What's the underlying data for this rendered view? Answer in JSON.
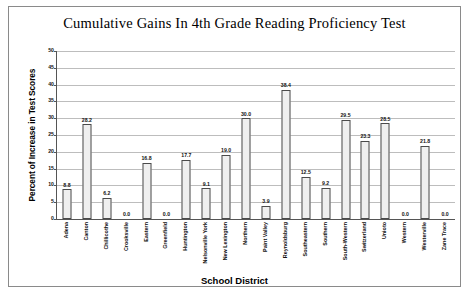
{
  "chart_data": {
    "type": "bar",
    "title": "Cumulative Gains In 4th Grade Reading Proficiency Test",
    "xlabel": "School District",
    "ylabel": "Percent of Increase in Test Scores",
    "ylim": [
      0,
      50
    ],
    "ytick_step": 5,
    "yticks": [
      "0",
      "5",
      "10",
      "15",
      "20",
      "25",
      "30",
      "35",
      "40",
      "45",
      "50"
    ],
    "grid": true,
    "legend": "none",
    "categories": [
      "Adena",
      "Canton",
      "Chillicothe",
      "Crooksville",
      "Eastern",
      "Greenfield",
      "Huntington",
      "Nelsonville York",
      "New Lexington",
      "Northern",
      "Paint Valley",
      "Reynoldsburg",
      "Southeastern",
      "Southern",
      "South-Western",
      "Switzerland",
      "Unioto",
      "Western",
      "Westerville",
      "Zane Trace"
    ],
    "values": [
      8.8,
      28.2,
      6.2,
      0.0,
      16.8,
      0.0,
      17.7,
      9.1,
      19.0,
      30.0,
      3.9,
      38.4,
      12.5,
      9.2,
      29.5,
      23.3,
      28.5,
      0.0,
      21.8,
      0.0
    ],
    "value_labels": [
      "8.8",
      "28.2",
      "6.2",
      "0.0",
      "16.8",
      "0.0",
      "17.7",
      "9.1",
      "19.0",
      "30.0",
      "3.9",
      "38.4",
      "12.5",
      "9.2",
      "29.5",
      "23.3",
      "28.5",
      "0.0",
      "21.8",
      "0.0"
    ],
    "colors": {
      "bar_fill": "#efefef",
      "bar_border": "#4a4a4a",
      "gridline": "#bdbdbd",
      "axis": "#555555",
      "text": "#111111",
      "frame": "#8a8a8a",
      "background": "#ffffff"
    }
  },
  "source_note": ""
}
